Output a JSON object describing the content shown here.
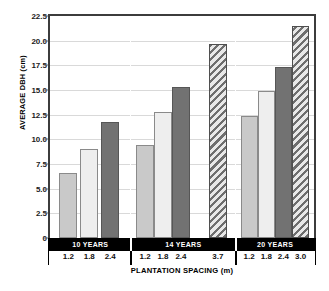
{
  "chart_data": {
    "type": "bar",
    "title": "",
    "xlabel": "PLANTATION SPACING (m)",
    "ylabel": "AVERAGE DBH (cm)",
    "ylim": [
      0,
      22.5
    ],
    "ytick_labels": [
      "22.5",
      "20.0",
      "17.5",
      "15.0",
      "12.5",
      "10.0",
      "7.5",
      "5.0",
      "2.5",
      "0"
    ],
    "ytick_values": [
      22.5,
      20.0,
      17.5,
      15.0,
      12.5,
      10.0,
      7.5,
      5.0,
      2.5,
      0
    ],
    "grid": true,
    "legend": "none",
    "group_label_name": "age",
    "groups": [
      {
        "label": "10 YEARS",
        "categories": [
          "1.2",
          "1.8",
          "2.4"
        ],
        "values": [
          6.6,
          9.05,
          11.75
        ],
        "fills": [
          "fill-light",
          "fill-white",
          "fill-dark"
        ]
      },
      {
        "label": "14 YEARS",
        "categories": [
          "1.2",
          "1.8",
          "2.4",
          "3.7"
        ],
        "values": [
          9.45,
          12.75,
          15.3,
          19.65
        ],
        "fills": [
          "fill-light",
          "fill-white",
          "fill-dark",
          "fill-hatch"
        ]
      },
      {
        "label": "20 YEARS",
        "categories": [
          "1.2",
          "1.8",
          "2.4",
          "3.0"
        ],
        "values": [
          12.4,
          14.9,
          17.3,
          21.45
        ],
        "fills": [
          "fill-light",
          "fill-white",
          "fill-dark",
          "fill-hatch"
        ]
      }
    ],
    "colors": {
      "fill_light": "#c9c9c9",
      "fill_white": "#eeeeee",
      "fill_dark": "#727272",
      "fill_hatch": "#6e6e6e",
      "axis": "#3c3c3c",
      "grid": "#d9d9d9",
      "band_background": "#000000",
      "band_text": "#ffffff"
    }
  }
}
